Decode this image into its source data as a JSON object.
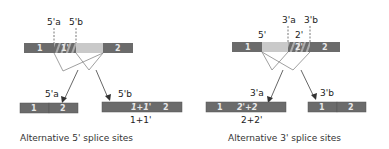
{
  "colors": {
    "exon_dark": "#6b6b6b",
    "exon_light": "#c9c9c9",
    "exon_text": "#eeeeee",
    "line": "#777777",
    "text": "#222222"
  },
  "left_panel": {
    "site_labels": [
      "5'a",
      "5'b"
    ],
    "pre_mrna": {
      "exon1": "1",
      "alt_region": "1'",
      "exon2": "2"
    },
    "products": [
      {
        "arrow_label": "5'a",
        "exons": [
          "1",
          "2"
        ]
      },
      {
        "arrow_label": "5'b",
        "exons": [
          "1+1'",
          "2"
        ],
        "annotation": "1+1'"
      }
    ],
    "caption": "Alternative 5' splice sites"
  },
  "right_panel": {
    "site_labels": [
      "5'",
      "2'",
      "3'a",
      "3'b"
    ],
    "pre_mrna": {
      "exon1": "1",
      "alt_region": "2'",
      "exon2": "2"
    },
    "products": [
      {
        "arrow_label": "3'a",
        "exons": [
          "1",
          "2'+2"
        ],
        "annotation": "2+2'"
      },
      {
        "arrow_label": "3'b",
        "exons": [
          "1",
          "2"
        ]
      }
    ],
    "caption": "Alternative 3' splice sites"
  }
}
